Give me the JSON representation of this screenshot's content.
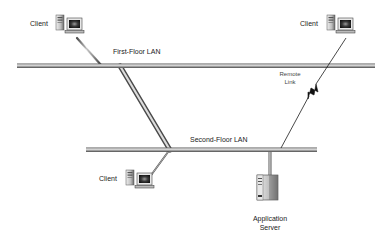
{
  "diagram": {
    "type": "network-topology",
    "colors": {
      "background": "#ffffff",
      "cable_light": "#d8d8d8",
      "cable_dark": "#6a6a6a",
      "text": "#222222",
      "remote_link": "#1a1a1a"
    },
    "nodes": [
      {
        "id": "client-1",
        "label": "Client",
        "kind": "workstation",
        "location": "first-floor"
      },
      {
        "id": "client-2",
        "label": "Client",
        "kind": "workstation",
        "location": "remote"
      },
      {
        "id": "client-3",
        "label": "Client",
        "kind": "workstation",
        "location": "second-floor"
      },
      {
        "id": "app-server",
        "label": "Application Server",
        "label_lines": [
          "Application",
          "Server"
        ],
        "kind": "server",
        "location": "second-floor"
      }
    ],
    "networks": [
      {
        "id": "lan-1",
        "label": "First-Floor LAN"
      },
      {
        "id": "lan-2",
        "label": "Second-Floor LAN"
      }
    ],
    "links": [
      {
        "from": "client-1",
        "to": "lan-1",
        "kind": "cable"
      },
      {
        "from": "lan-1",
        "to": "lan-2",
        "kind": "backbone"
      },
      {
        "from": "client-3",
        "to": "lan-2",
        "kind": "cable"
      },
      {
        "from": "app-server",
        "to": "lan-2",
        "kind": "cable"
      },
      {
        "from": "client-2",
        "to": "lan-2",
        "kind": "remote",
        "label": "Remote Link",
        "label_lines": [
          "Remote",
          "Link"
        ]
      }
    ]
  },
  "labels": {
    "client_top_left": "Client",
    "client_top_right": "Client",
    "client_bottom": "Client",
    "lan_first": "First-Floor LAN",
    "lan_second": "Second-Floor LAN",
    "remote_line1": "Remote",
    "remote_line2": "Link",
    "server_line1": "Application",
    "server_line2": "Server"
  }
}
